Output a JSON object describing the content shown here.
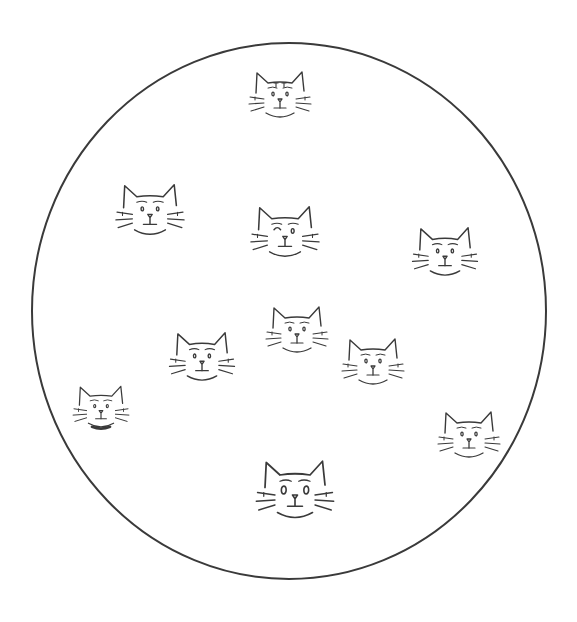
{
  "illustration": {
    "title": "Cat faces in a circle",
    "stroke_color": "#3a3a3a",
    "background_color": "#ffffff",
    "circle": {
      "cx": 289,
      "cy": 311,
      "rx": 257,
      "ry": 268
    },
    "cats": [
      {
        "id": "cat-top",
        "cx": 280,
        "cy": 95,
        "size": 1.0,
        "eyes": "dots",
        "mark": "forehead-stripes"
      },
      {
        "id": "cat-upper-left",
        "cx": 150,
        "cy": 210,
        "size": 1.1,
        "eyes": "brows",
        "mark": "none"
      },
      {
        "id": "cat-center-upper",
        "cx": 285,
        "cy": 232,
        "size": 1.1,
        "eyes": "wink",
        "mark": "none"
      },
      {
        "id": "cat-upper-right",
        "cx": 445,
        "cy": 252,
        "size": 1.05,
        "eyes": "dots",
        "mark": "none"
      },
      {
        "id": "cat-center",
        "cx": 297,
        "cy": 330,
        "size": 1.0,
        "eyes": "dots",
        "mark": "none"
      },
      {
        "id": "cat-mid-left",
        "cx": 202,
        "cy": 357,
        "size": 1.05,
        "eyes": "dots",
        "mark": "none"
      },
      {
        "id": "cat-mid-right",
        "cx": 373,
        "cy": 362,
        "size": 1.0,
        "eyes": "dots",
        "mark": "none"
      },
      {
        "id": "cat-lower-left",
        "cx": 101,
        "cy": 407,
        "size": 0.9,
        "eyes": "dots",
        "mark": "collar"
      },
      {
        "id": "cat-lower-right",
        "cx": 469,
        "cy": 435,
        "size": 1.0,
        "eyes": "dots",
        "mark": "none"
      },
      {
        "id": "cat-bottom",
        "cx": 295,
        "cy": 490,
        "size": 1.25,
        "eyes": "oval",
        "mark": "none"
      }
    ]
  }
}
